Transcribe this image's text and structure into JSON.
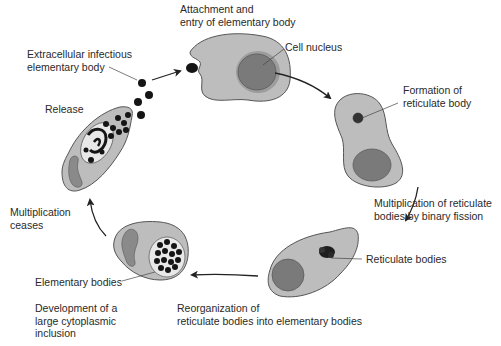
{
  "colors": {
    "cytoplasm": "#bdbdbd",
    "cell_outline": "#555555",
    "nucleus": "#7a7a7a",
    "nucleus_ring": "#9c9c9c",
    "body": "#151515",
    "arrow": "#222222",
    "text": "#2a2a2a"
  },
  "labels": {
    "attachment": [
      "Attachment and",
      "entry of elementary body"
    ],
    "extracellular": [
      "Extracellular infectious",
      "elementary body"
    ],
    "cell_nucleus": "Cell nucleus",
    "formation": [
      "Formation of",
      "reticulate body"
    ],
    "release": "Release",
    "multiplication_fission": [
      "Multiplication of reticulate",
      "bodies by binary fission"
    ],
    "multiplication_ceases": [
      "Multiplication",
      "ceases"
    ],
    "reticulate_bodies": "Reticulate bodies",
    "elementary_bodies": "Elementary bodies",
    "development": [
      "Development of a",
      "large cytoplasmic",
      "inclusion"
    ],
    "reorganization": [
      "Reorganization of",
      "reticulate bodies into elementary bodies"
    ]
  },
  "stages": [
    {
      "id": "attachment",
      "order": 1
    },
    {
      "id": "formation-reticulate-body",
      "order": 2
    },
    {
      "id": "binary-fission",
      "order": 3
    },
    {
      "id": "reorganization",
      "order": 4
    },
    {
      "id": "inclusion",
      "order": 5
    },
    {
      "id": "release",
      "order": 6
    }
  ]
}
